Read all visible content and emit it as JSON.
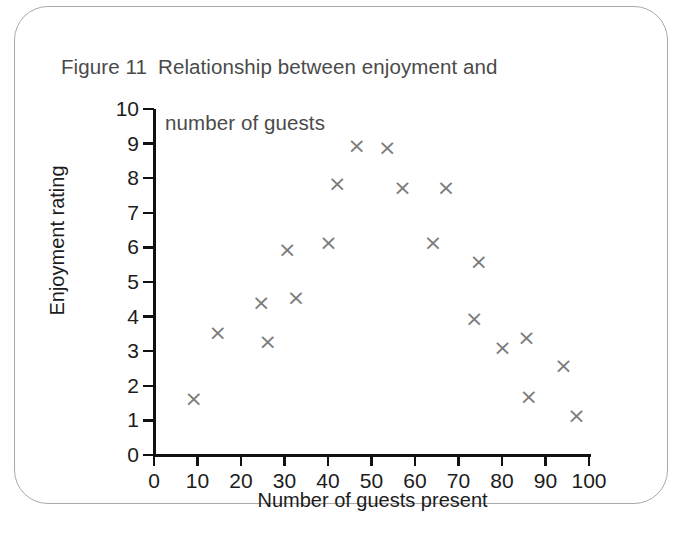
{
  "figure": {
    "label": "Figure 11",
    "title_line1": "Relationship between enjoyment and",
    "title_line2": "number of guests",
    "title_full": "Figure 11  Relationship between enjoyment and number of guests",
    "border_color": "#a9a9a9",
    "background_color": "#ffffff"
  },
  "chart_data": {
    "type": "scatter",
    "title": "Relationship between enjoyment and number of guests",
    "xlabel": "Number of guests present",
    "ylabel": "Enjoyment rating",
    "xlim": [
      0,
      100
    ],
    "ylim": [
      0,
      10
    ],
    "xticks": [
      0,
      10,
      20,
      30,
      40,
      50,
      60,
      70,
      80,
      90,
      100
    ],
    "yticks": [
      0,
      1,
      2,
      3,
      4,
      5,
      6,
      7,
      8,
      9,
      10
    ],
    "grid": false,
    "legend": null,
    "marker": "x",
    "marker_color": "#7c7c7c",
    "points": [
      {
        "x": 8.5,
        "y": 1.6
      },
      {
        "x": 14,
        "y": 3.5
      },
      {
        "x": 24,
        "y": 4.35
      },
      {
        "x": 25.5,
        "y": 3.25
      },
      {
        "x": 30,
        "y": 5.9
      },
      {
        "x": 32,
        "y": 4.5
      },
      {
        "x": 39.5,
        "y": 6.1
      },
      {
        "x": 41.5,
        "y": 7.8
      },
      {
        "x": 46,
        "y": 8.9
      },
      {
        "x": 53,
        "y": 8.85
      },
      {
        "x": 56.5,
        "y": 7.7
      },
      {
        "x": 63.5,
        "y": 6.1
      },
      {
        "x": 66.5,
        "y": 7.7
      },
      {
        "x": 73,
        "y": 3.9
      },
      {
        "x": 74,
        "y": 5.55
      },
      {
        "x": 79.5,
        "y": 3.05
      },
      {
        "x": 85,
        "y": 3.35
      },
      {
        "x": 85.5,
        "y": 1.65
      },
      {
        "x": 93.5,
        "y": 2.55
      },
      {
        "x": 96.5,
        "y": 1.1
      }
    ]
  }
}
